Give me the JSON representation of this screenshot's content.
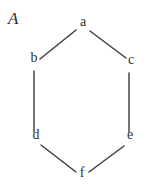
{
  "figure": {
    "label": "A",
    "label_x": 8,
    "label_y": 10,
    "width": 150,
    "height": 186,
    "background_color": "#ffffff",
    "line_color": "#3a3a3a",
    "text_color": "#2f2f2f",
    "line_width": 1.4
  },
  "nodes": [
    {
      "id": "a",
      "label": "a",
      "x": 83,
      "y": 26
    },
    {
      "id": "b",
      "label": "b",
      "x": 34,
      "y": 62
    },
    {
      "id": "c",
      "label": "c",
      "x": 131,
      "y": 64
    },
    {
      "id": "d",
      "label": "d",
      "x": 36,
      "y": 139
    },
    {
      "id": "e",
      "label": "e",
      "x": 130,
      "y": 139
    },
    {
      "id": "f",
      "label": "f",
      "x": 82,
      "y": 177
    }
  ],
  "edges": [
    {
      "id": "b-a",
      "from": "b",
      "to": "a",
      "x1": 40,
      "y1": 59,
      "x2": 76,
      "y2": 30
    },
    {
      "id": "a-c",
      "from": "a",
      "to": "c",
      "x1": 90,
      "y1": 31,
      "x2": 126,
      "y2": 58
    },
    {
      "id": "b-d",
      "from": "b",
      "to": "d",
      "x1": 34,
      "y1": 71,
      "x2": 34,
      "y2": 132
    },
    {
      "id": "c-e",
      "from": "c",
      "to": "e",
      "x1": 129,
      "y1": 73,
      "x2": 129,
      "y2": 132
    },
    {
      "id": "d-f",
      "from": "d",
      "to": "f",
      "x1": 41,
      "y1": 145,
      "x2": 76,
      "y2": 172
    },
    {
      "id": "f-e",
      "from": "f",
      "to": "e",
      "x1": 89,
      "y1": 172,
      "x2": 124,
      "y2": 146
    }
  ]
}
